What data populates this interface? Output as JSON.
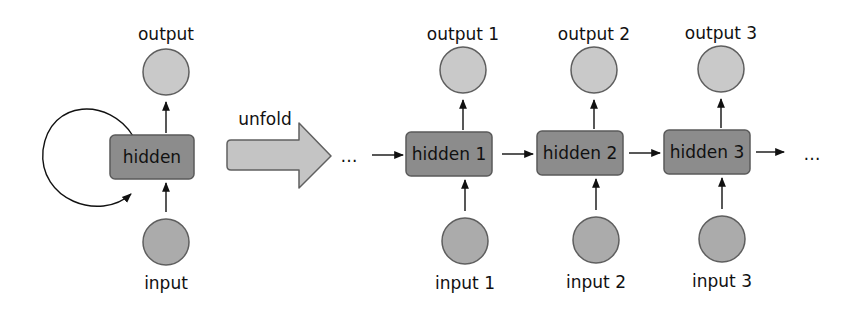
{
  "colors": {
    "background": "#ffffff",
    "hidden_fill": "#8c8c8c",
    "hidden_stroke": "#5a5a5a",
    "output_fill": "#c9c9c9",
    "input_fill": "#ababab",
    "circle_stroke": "#5e5e5e",
    "unfold_arrow_fill": "#c4c4c4",
    "unfold_arrow_stroke": "#606060",
    "line": "#111111"
  },
  "folded": {
    "output_label": "output",
    "hidden_label": "hidden",
    "input_label": "input",
    "output": {
      "cx": 166,
      "cy": 72,
      "r": 23
    },
    "hidden": {
      "x": 110,
      "y": 135,
      "w": 84,
      "h": 44
    },
    "input": {
      "cx": 166,
      "cy": 242,
      "r": 23
    },
    "loop": true
  },
  "unfold": {
    "label": "unfold",
    "ellipsis": "…"
  },
  "unfolded": {
    "leading_ellipsis": "…",
    "trailing_ellipsis": "…",
    "steps": [
      {
        "output_label": "output 1",
        "hidden_label": "hidden 1",
        "input_label": "input 1",
        "cx": 463,
        "box_x": 406,
        "box_y": 132
      },
      {
        "output_label": "output 2",
        "hidden_label": "hidden 2",
        "input_label": "input 2",
        "cx": 594,
        "box_x": 537,
        "box_y": 131
      },
      {
        "output_label": "output 3",
        "hidden_label": "hidden 3",
        "input_label": "input 3",
        "cx": 721,
        "box_x": 664,
        "box_y": 130
      }
    ],
    "box_w": 86,
    "box_h": 44,
    "circle_r": 23,
    "output_cy": 70,
    "input_cy": 241
  }
}
